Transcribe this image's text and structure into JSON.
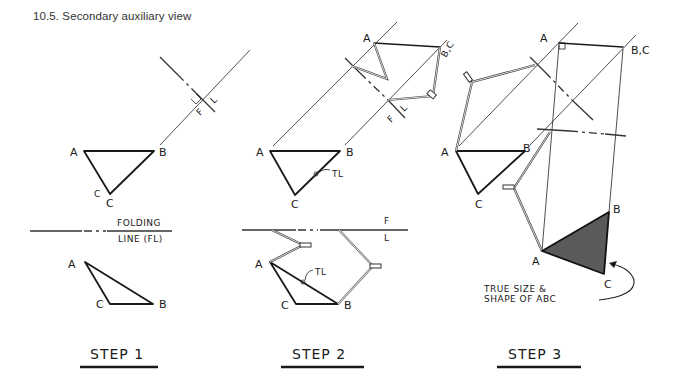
{
  "figure": {
    "caption": "10.5. Secondary auxiliary view",
    "steps": [
      {
        "label": "STEP 1",
        "points_top": {
          "A": "A",
          "B": "B",
          "C": "C"
        },
        "points_bottom": {
          "A": "A",
          "B": "B",
          "C": "C"
        },
        "folding_line_label_1": "FOLDING",
        "folding_line_label_2": "LINE (FL)",
        "aux_fl_labels": {
          "F": "F",
          "L": "L"
        }
      },
      {
        "label": "STEP 2",
        "points_top": {
          "A": "A",
          "B": "B",
          "C": "C"
        },
        "points_bottom": {
          "A": "A",
          "B": "B",
          "C": "C"
        },
        "points_aux": {
          "A": "A",
          "BC": "B,C"
        },
        "tl_label_top": "TL",
        "tl_label_bottom": "TL",
        "fl_labels": {
          "F": "F",
          "L": "L"
        },
        "aux_fl_labels": {
          "F": "F",
          "L": "L"
        }
      },
      {
        "label": "STEP 3",
        "points_top": {
          "A": "A",
          "B": "B",
          "C": "C"
        },
        "points_aux": {
          "A": "A",
          "BC": "B,C"
        },
        "points_true": {
          "A": "A",
          "B": "B",
          "C": "C"
        },
        "annotation_1": "TRUE SIZE &",
        "annotation_2": "SHAPE OF ABC"
      }
    ],
    "colors": {
      "ink": "#1a1a1a",
      "true_shape_fill": "#555555",
      "background": "#ffffff"
    }
  }
}
